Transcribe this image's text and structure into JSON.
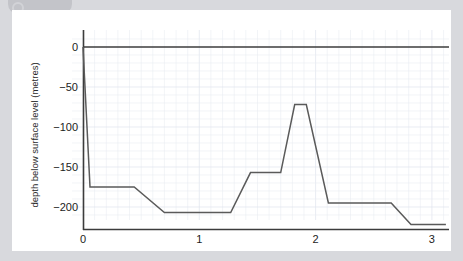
{
  "chart_data": {
    "type": "line",
    "title": "",
    "xlabel": "Exploration time of mini-sub   (hours)",
    "ylabel": "depth below surface level (metres)",
    "xlim": [
      -0.03,
      3.15
    ],
    "ylim": [
      -232,
      8
    ],
    "xticks": [
      0,
      1,
      2,
      3
    ],
    "xtick_labels": [
      "0",
      "1",
      "2",
      "3"
    ],
    "yticks": [
      0,
      -50,
      -100,
      -150,
      -200
    ],
    "ytick_labels": [
      "0",
      "−50",
      "−100",
      "−150",
      "−200"
    ],
    "grid": true,
    "grid_minor_x_step": 0.1,
    "grid_minor_y_step": 10,
    "legend": "none",
    "series": [
      {
        "name": "mini-sub depth",
        "color": "#5a5a5a",
        "x": [
          0.0,
          0.06,
          0.44,
          0.7,
          1.27,
          1.44,
          1.7,
          1.82,
          1.92,
          2.11,
          2.65,
          2.82,
          3.12
        ],
        "y": [
          0,
          -175,
          -175,
          -207,
          -207,
          -157,
          -157,
          -72,
          -72,
          -195,
          -195,
          -222,
          -222
        ]
      }
    ],
    "annotations": {
      "surface_reference_line": 0
    }
  },
  "axes": {
    "x_axis_name": "exploration-time-hours",
    "y_axis_name": "depth-below-surface-metres"
  }
}
